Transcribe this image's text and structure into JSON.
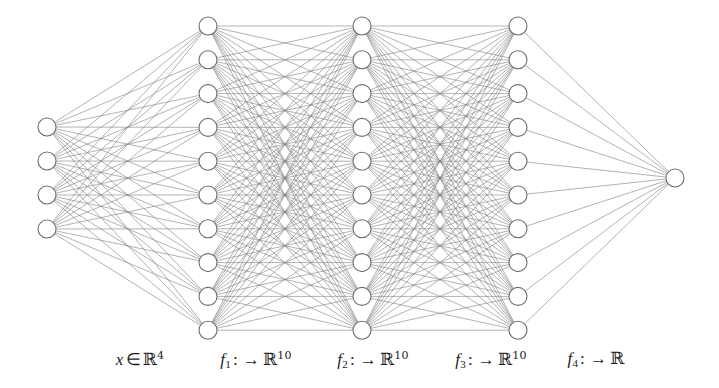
{
  "figure": {
    "type": "neural-network-diagram",
    "width": 719,
    "height": 388,
    "background_color": "#ffffff",
    "node_fill_color": "#ffffff",
    "node_stroke_color": "#6e6e6e",
    "edge_color": "#808080",
    "text_color": "#1c1c1c"
  },
  "network": {
    "layers": [
      {
        "id": "input",
        "name": "input-layer",
        "node_count": 4,
        "cx": 47,
        "first_cy": 127,
        "spacing": 34,
        "radius": 9
      },
      {
        "id": "hidden1",
        "name": "hidden-layer-1",
        "node_count": 10,
        "cx": 208,
        "first_cy": 26,
        "spacing": 33.8,
        "radius": 9
      },
      {
        "id": "hidden2",
        "name": "hidden-layer-2",
        "node_count": 10,
        "cx": 362,
        "first_cy": 26,
        "spacing": 33.8,
        "radius": 9
      },
      {
        "id": "hidden3",
        "name": "hidden-layer-3",
        "node_count": 10,
        "cx": 518,
        "first_cy": 26,
        "spacing": 33.8,
        "radius": 9
      },
      {
        "id": "output",
        "name": "output-layer",
        "node_count": 1,
        "cx": 675,
        "first_cy": 178,
        "spacing": 0,
        "radius": 9
      }
    ],
    "connections": [
      {
        "from": "input",
        "to": "hidden1"
      },
      {
        "from": "hidden1",
        "to": "hidden2"
      },
      {
        "from": "hidden2",
        "to": "hidden3"
      },
      {
        "from": "hidden3",
        "to": "output"
      }
    ]
  },
  "labels": [
    {
      "name": "input-label",
      "x": 140,
      "symbol": "x",
      "symbol_sub": "",
      "operator": "∈",
      "arrow": "",
      "codomain": "ℝ",
      "exponent": "4"
    },
    {
      "name": "f1-label",
      "x": 256,
      "symbol": "f",
      "symbol_sub": "1",
      "operator": ":",
      "arrow": "→",
      "codomain": "ℝ",
      "exponent": "10"
    },
    {
      "name": "f2-label",
      "x": 373,
      "symbol": "f",
      "symbol_sub": "2",
      "operator": ":",
      "arrow": "→",
      "codomain": "ℝ",
      "exponent": "10"
    },
    {
      "name": "f3-label",
      "x": 491,
      "symbol": "f",
      "symbol_sub": "3",
      "operator": ":",
      "arrow": "→",
      "codomain": "ℝ",
      "exponent": "10"
    },
    {
      "name": "f4-label",
      "x": 596,
      "symbol": "f",
      "symbol_sub": "4",
      "operator": ":",
      "arrow": "→",
      "codomain": "ℝ",
      "exponent": ""
    }
  ]
}
